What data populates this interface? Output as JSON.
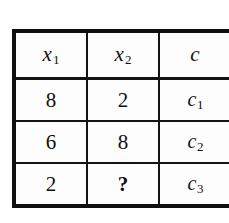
{
  "figure": {
    "type": "table",
    "background_color": "#fefefe",
    "border_color": "#100f0f",
    "text_color": "#111010"
  },
  "table": {
    "columns": [
      {
        "key": "x1",
        "symbol": "x",
        "subscript": "1",
        "display": "x₁"
      },
      {
        "key": "x2",
        "symbol": "x",
        "subscript": "2",
        "display": "x₂"
      },
      {
        "key": "c",
        "symbol": "c",
        "subscript": "",
        "display": "c"
      }
    ],
    "rows": [
      {
        "x1": "8",
        "x2": "2",
        "c_symbol": "c",
        "c_subscript": "1"
      },
      {
        "x1": "6",
        "x2": "8",
        "c_symbol": "c",
        "c_subscript": "2"
      },
      {
        "x1": "2",
        "x2": "?",
        "c_symbol": "c",
        "c_subscript": "3"
      }
    ]
  },
  "chart_data": {
    "type": "table",
    "title": "",
    "columns": [
      "x1",
      "x2",
      "c"
    ],
    "rows": [
      [
        "8",
        "2",
        "c1"
      ],
      [
        "6",
        "8",
        "c2"
      ],
      [
        "2",
        "?",
        "c3"
      ]
    ],
    "missing_values": [
      {
        "row": 3,
        "column": "x2",
        "marker": "?"
      }
    ]
  }
}
